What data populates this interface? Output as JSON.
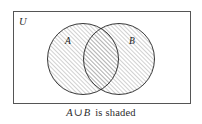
{
  "figure": {
    "type": "venn-diagram",
    "background_color": "#ffffff",
    "universe": {
      "label": "U",
      "border_color": "#555555",
      "fill_color": "#ffffff",
      "x": 13,
      "y": 11,
      "width": 177,
      "height": 92
    },
    "sets": [
      {
        "label": "A",
        "cx": 83,
        "cy": 59,
        "r": 36,
        "shaded": true,
        "label_x": 68,
        "label_y": 41
      },
      {
        "label": "B",
        "cx": 119,
        "cy": 59,
        "r": 36,
        "shaded": true,
        "label_x": 132,
        "label_y": 41
      }
    ],
    "shading": {
      "pattern": "diagonal-hatch",
      "angle_degrees": 45,
      "spacing_px": 3,
      "line_color": "#909090",
      "description": "A ∪ B is shaded"
    },
    "outline_color": "#222222"
  },
  "caption": {
    "full_text": "A ∪ B is shaded",
    "set_a": "A",
    "operator": "∪",
    "set_b": "B",
    "suffix": "is shaded"
  }
}
